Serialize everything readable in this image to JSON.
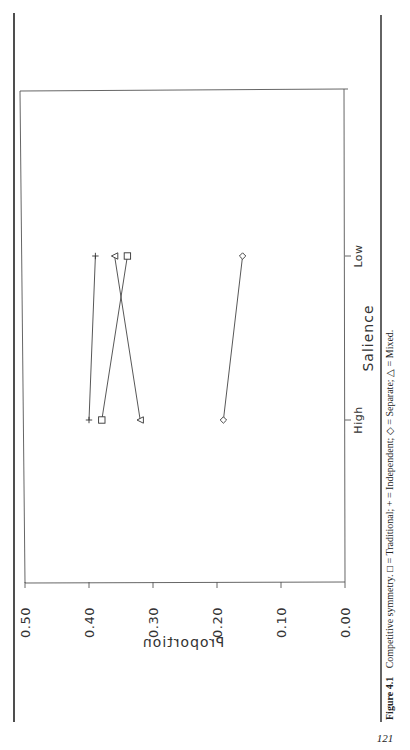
{
  "page": {
    "number": "121",
    "caption": {
      "label": "Figure 4.1",
      "text": "Competitive symmetry. □ = Traditional; + = Independent; ◇ = Separate; △ = Mixed."
    },
    "orientation": "rotated-90-clockwise"
  },
  "chart_data": {
    "type": "line",
    "title": "",
    "caption": "Figure 4.1 Competitive symmetry. □ = Traditional; + = Independent; ◇ = Separate; △ = Mixed.",
    "xlabel": "Salience",
    "ylabel": "Proportion",
    "categories": [
      "High",
      "Low"
    ],
    "ylim": [
      0.0,
      0.5
    ],
    "yticks": [
      "0.00",
      "0.10",
      "0.20",
      "0.30",
      "0.40",
      "0.50"
    ],
    "grid": false,
    "legend": "in caption",
    "series": [
      {
        "name": "Traditional",
        "marker": "square",
        "values": [
          0.38,
          0.34
        ]
      },
      {
        "name": "Independent",
        "marker": "plus",
        "values": [
          0.4,
          0.39
        ]
      },
      {
        "name": "Separate",
        "marker": "diamond",
        "values": [
          0.19,
          0.16
        ]
      },
      {
        "name": "Mixed",
        "marker": "triangle",
        "values": [
          0.32,
          0.36
        ]
      }
    ]
  }
}
